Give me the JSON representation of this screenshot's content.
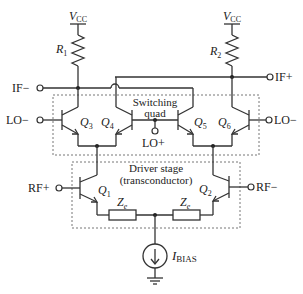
{
  "diagram": {
    "type": "Gilbert cell mixer schematic",
    "supplies": {
      "vcc_left": {
        "main": "V",
        "sub": "CC"
      },
      "vcc_right": {
        "main": "V",
        "sub": "CC"
      }
    },
    "resistors": {
      "r1": {
        "main": "R",
        "sub": "1"
      },
      "r2": {
        "main": "R",
        "sub": "2"
      },
      "ze_left": {
        "main": "Z",
        "sub": "e"
      },
      "ze_right": {
        "main": "Z",
        "sub": "e"
      }
    },
    "transistors": {
      "q1": {
        "main": "Q",
        "sub": "1"
      },
      "q2": {
        "main": "Q",
        "sub": "2"
      },
      "q3": {
        "main": "Q",
        "sub": "3"
      },
      "q4": {
        "main": "Q",
        "sub": "4"
      },
      "q5": {
        "main": "Q",
        "sub": "5"
      },
      "q6": {
        "main": "Q",
        "sub": "6"
      }
    },
    "terminals": {
      "if_minus": "IF−",
      "if_plus": "IF+",
      "lo_minus_left": "LO−",
      "lo_minus_right": "LO−",
      "lo_plus": "LO+",
      "rf_plus": "RF+",
      "rf_minus": "RF−"
    },
    "blocks": {
      "switching_quad": {
        "line1": "Switching",
        "line2": "quad"
      },
      "driver_stage": {
        "line1": "Driver stage",
        "line2": "(transconductor)"
      }
    },
    "current_source": {
      "main": "I",
      "sub": "BIAS"
    }
  }
}
